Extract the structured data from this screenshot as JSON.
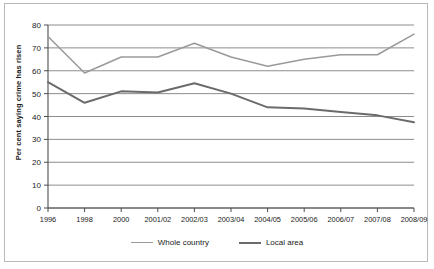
{
  "chart_data": {
    "type": "line",
    "title": "",
    "xlabel": "",
    "ylabel": "Per cent saying crime has risen",
    "ylim": [
      0,
      80
    ],
    "ytick_step": 10,
    "yticks": [
      0,
      10,
      20,
      30,
      40,
      50,
      60,
      70,
      80
    ],
    "grid": true,
    "legend_position": "bottom",
    "categories": [
      "1996",
      "1998",
      "2000",
      "2001/02",
      "2002/03",
      "2003/04",
      "2004/05",
      "2005/06",
      "2006/07",
      "2007/08",
      "2008/09"
    ],
    "series": [
      {
        "name": "Whole country",
        "color": "#9a9a9a",
        "values": [
          75,
          59,
          66,
          66,
          72,
          66,
          62,
          65,
          67,
          67,
          76
        ]
      },
      {
        "name": "Local area",
        "color": "#6b6b6b",
        "values": [
          55,
          46,
          51,
          50.5,
          54.5,
          50,
          44,
          43.5,
          42,
          40.5,
          37.5
        ]
      }
    ]
  },
  "axis": {
    "y_title": "Per cent saying crime has risen",
    "y_labels": [
      "80",
      "70",
      "60",
      "50",
      "40",
      "30",
      "20",
      "10",
      "0"
    ],
    "x_labels": [
      "1996",
      "1998",
      "2000",
      "2001/02",
      "2002/03",
      "2003/04",
      "2004/05",
      "2005/06",
      "2006/07",
      "2007/08",
      "2008/09"
    ]
  },
  "legend": {
    "items": [
      {
        "label": "Whole country",
        "color": "#9a9a9a"
      },
      {
        "label": "Local area",
        "color": "#6b6b6b"
      }
    ]
  },
  "colors": {
    "whole_country": "#9a9a9a",
    "local_area": "#6b6b6b",
    "gridline": "#808080",
    "axis": "#4d4d4d",
    "frame": "#b9b9b9",
    "background": "#ffffff"
  }
}
